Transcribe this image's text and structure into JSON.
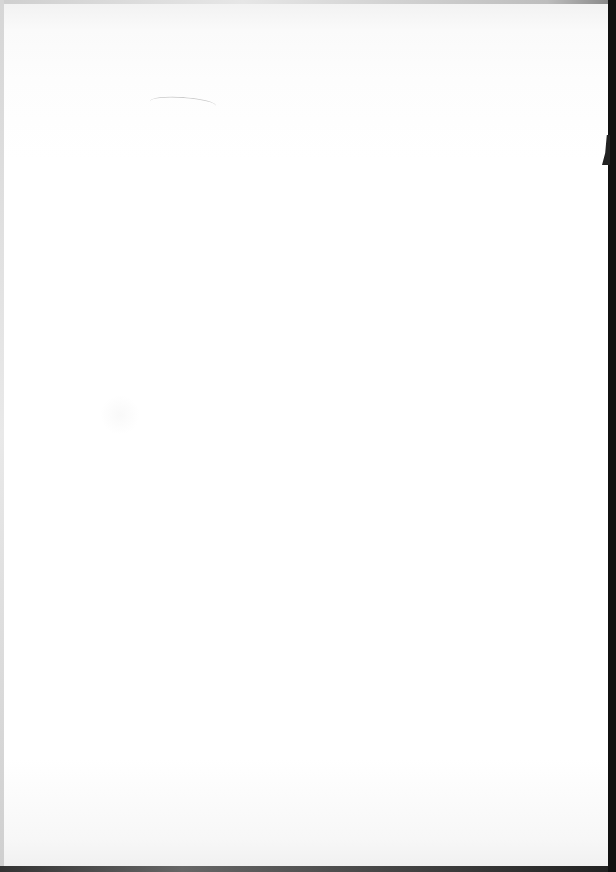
{
  "document": {
    "type": "scanned-page",
    "content": "",
    "colors": {
      "paper": "#ffffff",
      "scanner_edge": "#111111"
    }
  }
}
